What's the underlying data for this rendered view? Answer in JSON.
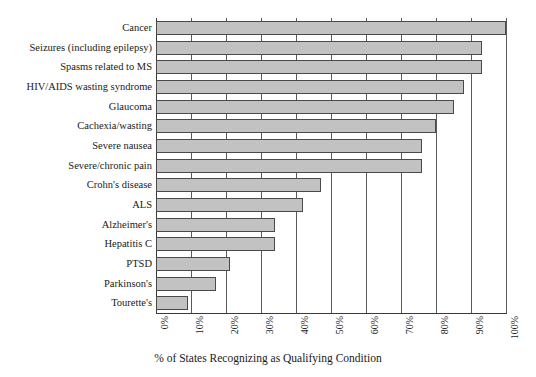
{
  "chart_data": {
    "type": "bar",
    "orientation": "horizontal",
    "title": "",
    "xlabel": "% of States Recognizing as Qualifying Condition",
    "ylabel": "",
    "xlim": [
      0,
      100
    ],
    "grid": true,
    "legend": false,
    "bar_fill_color": "#c2c2c2",
    "bar_border_color": "#4a4a4a",
    "x_tick_labels": [
      "0%",
      "10%",
      "20%",
      "30%",
      "40%",
      "50%",
      "60%",
      "70%",
      "80%",
      "90%",
      "100%"
    ],
    "x_tick_values": [
      0,
      10,
      20,
      30,
      40,
      50,
      60,
      70,
      80,
      90,
      100
    ],
    "categories": [
      "Cancer",
      "Seizures (including epilepsy)",
      "Spasms related to MS",
      "HIV/AIDS wasting syndrome",
      "Glaucoma",
      "Cachexia/wasting",
      "Severe nausea",
      "Severe/chronic pain",
      "Crohn's disease",
      "ALS",
      "Alzheimer's",
      "Hepatitis C",
      "PTSD",
      "Parkinson's",
      "Tourette's"
    ],
    "values": [
      100,
      93,
      93,
      88,
      85,
      80,
      76,
      76,
      47,
      42,
      34,
      34,
      21,
      17,
      9
    ]
  }
}
